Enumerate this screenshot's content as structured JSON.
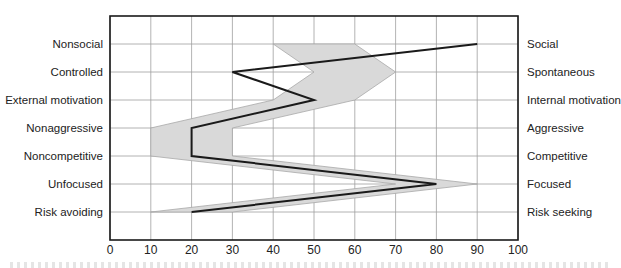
{
  "chart_data": {
    "type": "line",
    "title": "",
    "xlabel": "",
    "ylabel": "",
    "xlim": [
      0,
      100
    ],
    "x_ticks": [
      0,
      10,
      20,
      30,
      40,
      50,
      60,
      70,
      80,
      90,
      100
    ],
    "grid": true,
    "legend": null,
    "left_labels": [
      "Nonsocial",
      "Controlled",
      "External motivation",
      "Nonaggressive",
      "Noncompetitive",
      "Unfocused",
      "Risk avoiding"
    ],
    "right_labels": [
      "Social",
      "Spontaneous",
      "Internal motivation",
      "Aggressive",
      "Competitive",
      "Focused",
      "Risk seeking"
    ],
    "series": [
      {
        "name": "profile",
        "style": "line",
        "color": "#1a1a1a",
        "values": [
          90,
          30,
          50,
          20,
          20,
          80,
          20
        ]
      },
      {
        "name": "range",
        "style": "band",
        "color": "#d9d9d9",
        "lower": [
          40,
          50,
          40,
          10,
          10,
          70,
          10
        ],
        "upper": [
          60,
          70,
          60,
          30,
          30,
          90,
          30
        ]
      }
    ]
  },
  "colors": {
    "band_fill": "#d9d9d9",
    "band_edge": "#a8a8a8",
    "line": "#1a1a1a",
    "grid": "#a0a0a0",
    "frame": "#1a1a1a"
  }
}
